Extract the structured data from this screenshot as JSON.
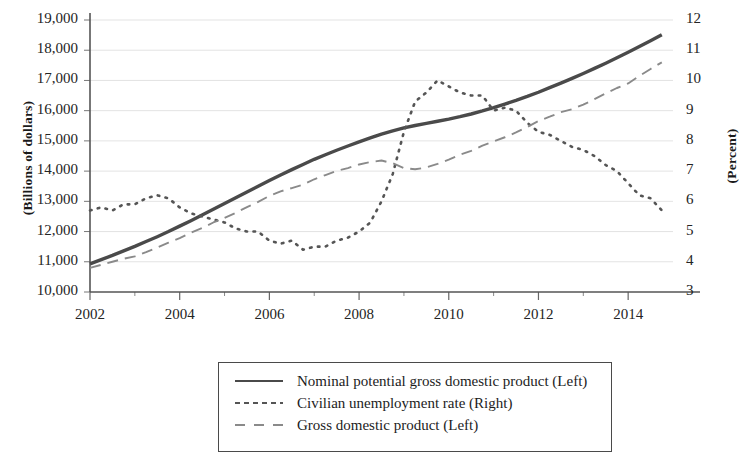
{
  "chart_data": {
    "type": "line",
    "title": "",
    "xlabel": "",
    "ylabel": "(Billions of dollars)",
    "y2label": "(Percent)",
    "grid": true,
    "legend_position": "bottom",
    "xlim": [
      2002,
      2015
    ],
    "ylim": [
      10000,
      19000
    ],
    "y2lim": [
      3,
      12
    ],
    "x_ticks": [
      2002,
      2004,
      2006,
      2008,
      2010,
      2012,
      2014
    ],
    "x_tick_labels": [
      "2002",
      "2004",
      "2006",
      "2008",
      "2010",
      "2012",
      "2014"
    ],
    "y_ticks": [
      10000,
      11000,
      12000,
      13000,
      14000,
      15000,
      16000,
      17000,
      18000,
      19000
    ],
    "y_tick_labels": [
      "10,000",
      "11,000",
      "12,000",
      "13,000",
      "14,000",
      "15,000",
      "16,000",
      "17,000",
      "18,000",
      "19,000"
    ],
    "y2_ticks": [
      3,
      4,
      5,
      6,
      7,
      8,
      9,
      10,
      11,
      12
    ],
    "y2_tick_labels": [
      "3",
      "4",
      "5",
      "6",
      "7",
      "8",
      "9",
      "10",
      "11",
      "12"
    ],
    "x": [
      2002.0,
      2002.25,
      2002.5,
      2002.75,
      2003.0,
      2003.25,
      2003.5,
      2003.75,
      2004.0,
      2004.25,
      2004.5,
      2004.75,
      2005.0,
      2005.25,
      2005.5,
      2005.75,
      2006.0,
      2006.25,
      2006.5,
      2006.75,
      2007.0,
      2007.25,
      2007.5,
      2007.75,
      2008.0,
      2008.25,
      2008.5,
      2008.75,
      2009.0,
      2009.25,
      2009.5,
      2009.75,
      2010.0,
      2010.25,
      2010.5,
      2010.75,
      2011.0,
      2011.25,
      2011.5,
      2011.75,
      2012.0,
      2012.25,
      2012.5,
      2012.75,
      2013.0,
      2013.25,
      2013.5,
      2013.75,
      2014.0,
      2014.25,
      2014.5,
      2014.75
    ],
    "series": [
      {
        "name": "Nominal potential gross domestic product (Left)",
        "axis": "left",
        "style": "solid",
        "color": "#4a4a4a",
        "values": [
          10930,
          11070,
          11210,
          11360,
          11510,
          11670,
          11830,
          12000,
          12180,
          12360,
          12550,
          12740,
          12930,
          13120,
          13310,
          13500,
          13690,
          13870,
          14050,
          14220,
          14390,
          14540,
          14690,
          14830,
          14970,
          15100,
          15220,
          15330,
          15430,
          15510,
          15580,
          15650,
          15720,
          15800,
          15890,
          15990,
          16100,
          16220,
          16340,
          16470,
          16610,
          16760,
          16910,
          17070,
          17230,
          17400,
          17570,
          17750,
          17930,
          18120,
          18310,
          18510
        ]
      },
      {
        "name": "Civilian unemployment rate (Right)",
        "axis": "right",
        "style": "dotted",
        "color": "#555555",
        "values": [
          5.7,
          5.8,
          5.7,
          5.9,
          5.9,
          6.1,
          6.2,
          6.1,
          5.8,
          5.6,
          5.5,
          5.4,
          5.3,
          5.1,
          5.0,
          5.0,
          4.7,
          4.6,
          4.7,
          4.4,
          4.5,
          4.5,
          4.7,
          4.8,
          5.0,
          5.3,
          6.0,
          6.9,
          8.3,
          9.3,
          9.6,
          10.0,
          9.8,
          9.6,
          9.5,
          9.5,
          9.0,
          9.1,
          9.0,
          8.6,
          8.3,
          8.2,
          8.0,
          7.8,
          7.7,
          7.5,
          7.2,
          7.0,
          6.6,
          6.2,
          6.1,
          5.7
        ]
      },
      {
        "name": "Gross domestic product (Left)",
        "axis": "left",
        "style": "dashed",
        "color": "#8a8a8a",
        "values": [
          10800,
          10900,
          11000,
          11100,
          11180,
          11320,
          11470,
          11630,
          11780,
          11960,
          12120,
          12300,
          12450,
          12620,
          12810,
          12980,
          13180,
          13330,
          13440,
          13550,
          13730,
          13870,
          14010,
          14100,
          14220,
          14300,
          14350,
          14260,
          14100,
          14060,
          14120,
          14240,
          14380,
          14540,
          14670,
          14840,
          14980,
          15120,
          15280,
          15460,
          15660,
          15800,
          15950,
          16050,
          16200,
          16380,
          16570,
          16750,
          16900,
          17150,
          17380,
          17600
        ]
      }
    ]
  },
  "legend": {
    "entries": [
      {
        "label": "Nominal potential gross domestic product (Left)",
        "style": "solid"
      },
      {
        "label": "Civilian unemployment rate (Right)",
        "style": "dotted"
      },
      {
        "label": "Gross domestic product (Left)",
        "style": "dashed"
      }
    ]
  }
}
